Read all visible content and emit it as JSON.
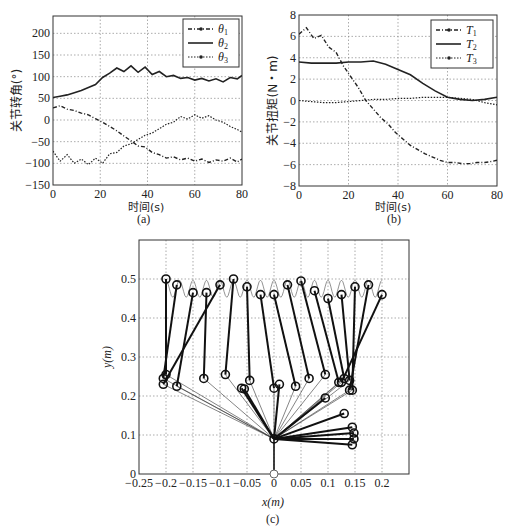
{
  "chart_data": [
    {
      "id": "a",
      "type": "line",
      "caption": "(a)",
      "xlabel": "时间(s)",
      "ylabel": "关节转角(°)",
      "xlim": [
        0,
        80
      ],
      "ylim": [
        -150,
        240
      ],
      "xticks": [
        0,
        20,
        40,
        60,
        80
      ],
      "yticks": [
        -150,
        -100,
        -50,
        0,
        50,
        100,
        150,
        200
      ],
      "grid": true,
      "legend_position": "upper right",
      "series": [
        {
          "name": "θ1",
          "style": "dash-dot-marker",
          "x": [
            0,
            3,
            6,
            9,
            12,
            15,
            18,
            21,
            24,
            27,
            30,
            33,
            36,
            39,
            42,
            45,
            48,
            51,
            54,
            57,
            60,
            63,
            66,
            69,
            72,
            75,
            78,
            80
          ],
          "y": [
            28,
            33,
            25,
            22,
            16,
            12,
            3,
            -5,
            -15,
            -25,
            -37,
            -48,
            -60,
            -62,
            -75,
            -80,
            -88,
            -85,
            -92,
            -88,
            -95,
            -90,
            -98,
            -92,
            -95,
            -88,
            -97,
            -90
          ]
        },
        {
          "name": "θ2",
          "style": "solid",
          "x": [
            0,
            3,
            6,
            9,
            12,
            15,
            18,
            21,
            24,
            27,
            30,
            33,
            36,
            39,
            42,
            45,
            48,
            51,
            54,
            57,
            60,
            63,
            66,
            69,
            72,
            75,
            78,
            80
          ],
          "y": [
            52,
            55,
            58,
            63,
            68,
            75,
            82,
            98,
            108,
            120,
            112,
            125,
            110,
            122,
            105,
            112,
            100,
            103,
            96,
            98,
            92,
            96,
            90,
            95,
            88,
            98,
            95,
            103
          ]
        },
        {
          "name": "θ3",
          "style": "dotted-marker",
          "x": [
            0,
            3,
            6,
            9,
            12,
            15,
            18,
            21,
            24,
            27,
            30,
            33,
            36,
            39,
            42,
            45,
            48,
            51,
            54,
            57,
            60,
            63,
            66,
            69,
            72,
            75,
            78,
            80
          ],
          "y": [
            -72,
            -95,
            -80,
            -100,
            -90,
            -103,
            -88,
            -100,
            -78,
            -75,
            -60,
            -55,
            -45,
            -35,
            -30,
            -20,
            -10,
            -5,
            8,
            2,
            12,
            4,
            10,
            0,
            -5,
            -15,
            -22,
            -28
          ]
        }
      ]
    },
    {
      "id": "b",
      "type": "line",
      "caption": "(b)",
      "xlabel": "时间(s)",
      "ylabel": "关节扭矩(N・m)",
      "xlim": [
        0,
        80
      ],
      "ylim": [
        -8,
        8
      ],
      "xticks": [
        0,
        20,
        40,
        60,
        80
      ],
      "yticks": [
        -8,
        -6,
        -4,
        -2,
        0,
        2,
        4,
        6,
        8
      ],
      "grid": true,
      "legend_position": "upper right",
      "series": [
        {
          "name": "T1",
          "style": "dash-dot-marker",
          "x": [
            0,
            3,
            6,
            9,
            12,
            15,
            18,
            21,
            24,
            27,
            30,
            33,
            36,
            39,
            42,
            45,
            48,
            51,
            54,
            57,
            60,
            63,
            66,
            69,
            72,
            75,
            78,
            80
          ],
          "y": [
            6.2,
            6.8,
            5.8,
            6.1,
            5.0,
            4.5,
            3.2,
            2.2,
            1.2,
            0.0,
            -0.8,
            -1.6,
            -2.2,
            -3.0,
            -3.6,
            -4.2,
            -4.6,
            -5.0,
            -5.3,
            -5.6,
            -5.8,
            -5.8,
            -5.9,
            -5.9,
            -5.8,
            -5.8,
            -5.7,
            -5.6
          ]
        },
        {
          "name": "T2",
          "style": "solid",
          "x": [
            0,
            5,
            10,
            15,
            20,
            25,
            30,
            35,
            40,
            45,
            50,
            55,
            60,
            65,
            70,
            75,
            80
          ],
          "y": [
            3.6,
            3.5,
            3.5,
            3.5,
            3.6,
            3.6,
            3.7,
            3.4,
            2.9,
            2.4,
            1.6,
            0.9,
            0.3,
            0.1,
            0.0,
            0.1,
            0.3
          ]
        },
        {
          "name": "T3",
          "style": "dotted-marker",
          "x": [
            0,
            5,
            10,
            15,
            20,
            25,
            30,
            35,
            40,
            45,
            50,
            55,
            60,
            65,
            70,
            75,
            80
          ],
          "y": [
            0.0,
            -0.1,
            -0.2,
            -0.2,
            -0.1,
            0.0,
            0.1,
            0.1,
            0.2,
            0.2,
            0.3,
            0.3,
            0.3,
            0.2,
            0.1,
            -0.2,
            -0.4
          ]
        }
      ]
    },
    {
      "id": "c",
      "type": "scatter",
      "subtype": "linkage-trajectory",
      "caption": "(c)",
      "xlabel": "x(m)",
      "ylabel": "y(m)",
      "xlim": [
        -0.25,
        0.25
      ],
      "ylim": [
        0,
        0.6
      ],
      "xticks": [
        -0.25,
        -0.2,
        -0.15,
        -0.1,
        -0.05,
        0,
        0.05,
        0.1,
        0.15,
        0.2
      ],
      "yticks": [
        0,
        0.1,
        0.2,
        0.3,
        0.4,
        0.5
      ],
      "grid": true,
      "base": [
        0,
        0
      ],
      "shoulder": [
        0,
        0.09
      ],
      "frames": [
        {
          "elbow": [
            -0.2,
            0.255
          ],
          "tip": [
            -0.2,
            0.5
          ]
        },
        {
          "elbow": [
            -0.205,
            0.245
          ],
          "tip": [
            -0.18,
            0.485
          ]
        },
        {
          "elbow": [
            -0.18,
            0.225
          ],
          "tip": [
            -0.15,
            0.465
          ]
        },
        {
          "elbow": [
            -0.13,
            0.245
          ],
          "tip": [
            -0.125,
            0.465
          ]
        },
        {
          "elbow": [
            -0.205,
            0.23
          ],
          "tip": [
            -0.1,
            0.485
          ]
        },
        {
          "elbow": [
            -0.09,
            0.255
          ],
          "tip": [
            -0.075,
            0.5
          ]
        },
        {
          "elbow": [
            -0.045,
            0.24
          ],
          "tip": [
            -0.05,
            0.48
          ]
        },
        {
          "elbow": [
            0.0,
            0.22
          ],
          "tip": [
            -0.025,
            0.46
          ]
        },
        {
          "elbow": [
            0.04,
            0.225
          ],
          "tip": [
            0.0,
            0.46
          ]
        },
        {
          "elbow": [
            0.065,
            0.245
          ],
          "tip": [
            0.025,
            0.485
          ]
        },
        {
          "elbow": [
            0.095,
            0.255
          ],
          "tip": [
            0.05,
            0.495
          ]
        },
        {
          "elbow": [
            0.12,
            0.235
          ],
          "tip": [
            0.075,
            0.47
          ]
        },
        {
          "elbow": [
            0.13,
            0.245
          ],
          "tip": [
            0.1,
            0.45
          ]
        },
        {
          "elbow": [
            0.14,
            0.24
          ],
          "tip": [
            0.125,
            0.46
          ]
        },
        {
          "elbow": [
            0.145,
            0.215
          ],
          "tip": [
            0.15,
            0.48
          ]
        },
        {
          "elbow": [
            0.14,
            0.215
          ],
          "tip": [
            0.175,
            0.485
          ]
        },
        {
          "elbow": [
            0.125,
            0.235
          ],
          "tip": [
            0.2,
            0.46
          ]
        }
      ],
      "inner_joints": [
        [
          -0.06,
          0.22
        ],
        [
          -0.055,
          0.218
        ],
        [
          0.01,
          0.23
        ],
        [
          0.095,
          0.195
        ],
        [
          0.13,
          0.155
        ],
        [
          0.145,
          0.12
        ],
        [
          0.148,
          0.105
        ],
        [
          0.148,
          0.09
        ],
        [
          0.145,
          0.075
        ]
      ],
      "tip_trajectory_note": "wavy thin curve between y≈0.45 and y≈0.50 from x≈-0.2 to x≈0.2"
    }
  ],
  "header_fragment": "",
  "colors": {
    "line": "#222222",
    "grid": "#999999",
    "background": "#ffffff"
  }
}
